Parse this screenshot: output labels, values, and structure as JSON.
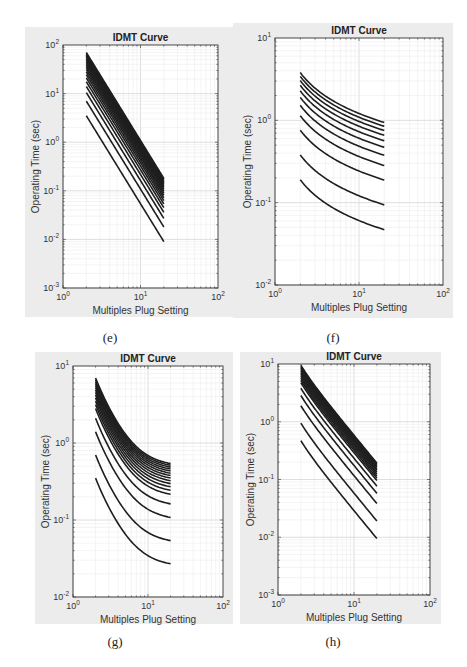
{
  "figure": {
    "captions": [
      "(e)",
      "(f)",
      "(g)",
      "(h)"
    ]
  },
  "chart_data": [
    {
      "id": "e",
      "type": "line",
      "title": "IDMT Curve",
      "xlabel": "Multiples Plug Setting",
      "ylabel": "Operating Time (sec)",
      "xscale": "log",
      "yscale": "log",
      "xlim": [
        1,
        100
      ],
      "ylim": [
        0.001,
        100
      ],
      "xticks": [
        "10^0",
        "10^1",
        "10^2"
      ],
      "yticks": [
        "10^-3",
        "10^-2",
        "10^-1",
        "10^0",
        "10^1",
        "10^2"
      ],
      "grid": true,
      "x_range": [
        2,
        20
      ],
      "curve_model": "t = k * base(M); base(M) ~ M^-2.59",
      "series_count": 20,
      "series_bottom": {
        "x": [
          2,
          20
        ],
        "y": [
          3.5,
          0.009
        ]
      },
      "series_top": {
        "x": [
          2,
          20
        ],
        "y": [
          70,
          0.17
        ]
      },
      "multipliers": [
        1,
        2,
        3,
        4,
        5,
        6,
        7,
        8,
        9,
        10,
        11,
        12,
        13,
        14,
        15,
        16,
        17,
        18,
        19,
        20
      ],
      "base": {
        "start": 3.5,
        "end": 0.009,
        "shape": "power"
      }
    },
    {
      "id": "f",
      "type": "line",
      "title": "IDMT Curve",
      "xlabel": "Multiples Plug Setting",
      "ylabel": "Operating Time (sec)",
      "xscale": "log",
      "yscale": "log",
      "xlim": [
        1,
        100
      ],
      "ylim": [
        0.01,
        10
      ],
      "xticks": [
        "10^0",
        "10^1",
        "10^2"
      ],
      "yticks": [
        "10^-2",
        "10^-1",
        "10^0",
        "10^1"
      ],
      "grid": true,
      "x_range": [
        2,
        20
      ],
      "series_count": 11,
      "series_bottom": {
        "x": [
          2,
          20
        ],
        "y": [
          0.19,
          0.047
        ]
      },
      "series_top": {
        "x": [
          2,
          20
        ],
        "y": [
          3.8,
          0.95
        ]
      },
      "multipliers": [
        1,
        2,
        4,
        6,
        8,
        10,
        12,
        14,
        16,
        18,
        20
      ],
      "base": {
        "start": 0.19,
        "end": 0.047,
        "shape": "standard-inverse",
        "alpha": 0.02
      }
    },
    {
      "id": "g",
      "type": "line",
      "title": "IDMT Curve",
      "xlabel": "Multiples Plug Setting",
      "ylabel": "Operating Time (sec)",
      "xscale": "log",
      "yscale": "log",
      "xlim": [
        1,
        100
      ],
      "ylim": [
        0.01,
        10
      ],
      "xticks": [
        "10^0",
        "10^1",
        "10^2"
      ],
      "yticks": [
        "10^-2",
        "10^-1",
        "10^0",
        "10^1"
      ],
      "grid": true,
      "x_range": [
        2,
        20
      ],
      "series_count": 20,
      "series_bottom": {
        "x": [
          2,
          20
        ],
        "y": [
          0.35,
          0.027
        ]
      },
      "series_top": {
        "x": [
          2,
          20
        ],
        "y": [
          7.0,
          0.54
        ]
      },
      "multipliers": [
        1,
        2,
        4,
        6,
        8,
        9,
        10,
        11,
        12,
        13,
        14,
        15,
        16,
        17,
        18,
        19,
        20
      ],
      "base": {
        "start": 0.35,
        "end": 0.027,
        "shape": "very-inverse-offset"
      }
    },
    {
      "id": "h",
      "type": "line",
      "title": "IDMT Curve",
      "xlabel": "Multiples Plug Setting",
      "ylabel": "Operating Time (sec)",
      "xscale": "log",
      "yscale": "log",
      "xlim": [
        1,
        100
      ],
      "ylim": [
        0.001,
        10
      ],
      "xticks": [
        "10^0",
        "10^1",
        "10^2"
      ],
      "yticks": [
        "10^-3",
        "10^-2",
        "10^-1",
        "10^0",
        "10^1"
      ],
      "grid": true,
      "x_range": [
        2,
        20
      ],
      "series_count": 20,
      "series_bottom": {
        "x": [
          2,
          20
        ],
        "y": [
          0.47,
          0.0095
        ]
      },
      "series_top": {
        "x": [
          2,
          20
        ],
        "y": [
          9.5,
          0.19
        ]
      },
      "multipliers": [
        1,
        2,
        4,
        6,
        8,
        10,
        11,
        12,
        13,
        14,
        15,
        16,
        17,
        18,
        19,
        20
      ],
      "base": {
        "start": 0.47,
        "end": 0.0095,
        "shape": "extremely-inverse"
      }
    }
  ],
  "layout": {
    "panels": [
      {
        "id": "e",
        "bg": [
          25,
          27,
          208,
          290
        ],
        "plot": [
          63,
          45,
          218,
          288
        ],
        "caption_xy": [
          110,
          330
        ]
      },
      {
        "id": "f",
        "bg": [
          233,
          23,
          220,
          295
        ],
        "plot": [
          275,
          38,
          443,
          285
        ],
        "caption_xy": [
          333,
          330
        ]
      },
      {
        "id": "g",
        "bg": [
          35,
          352,
          198,
          272
        ],
        "plot": [
          73,
          366,
          223,
          597
        ],
        "caption_xy": [
          115,
          634
        ]
      },
      {
        "id": "h",
        "bg": [
          240,
          352,
          201,
          272
        ],
        "plot": [
          278,
          364,
          430,
          595
        ],
        "caption_xy": [
          333,
          634
        ]
      }
    ]
  }
}
